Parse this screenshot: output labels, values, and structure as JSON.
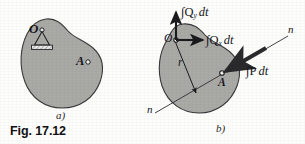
{
  "figure": {
    "caption": "Fig. 17.12",
    "panel_a_label": "a)",
    "panel_b_label": "b)",
    "body_fill": "#a9a9a6",
    "body_stroke": "#3a3a3c",
    "ink": "#16161a",
    "page_background": "#fdfdfc"
  },
  "panel_a": {
    "point_o_label": "O",
    "point_a_label": "A",
    "support_icon": "pin-support-icon",
    "description": "Rigid body pinned at O with point A on its boundary"
  },
  "panel_b": {
    "point_o_label": "O",
    "point_a_label": "A",
    "radius_label": "r",
    "axis_label_upper": "n",
    "axis_label_lower": "n",
    "impulse_y": {
      "integral": "∫",
      "symbol": "Q",
      "subscript": "y",
      "differential": "dt"
    },
    "impulse_x": {
      "integral": "∫",
      "symbol": "Q",
      "subscript": "x",
      "differential": "dt"
    },
    "impulse_p": {
      "integral": "∫",
      "symbol": "P",
      "subscript": "",
      "differential": "dt"
    },
    "description": "Free-body impulse-momentum diagram: reaction impulses at O and applied impulse P dt at A along line n-n"
  }
}
